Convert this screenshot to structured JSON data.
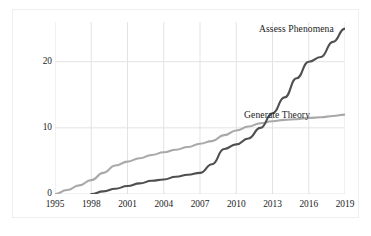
{
  "chart_data": {
    "type": "line",
    "title": "",
    "xlabel": "",
    "ylabel": "Cumulative number of studies",
    "xlim": [
      1995,
      2019
    ],
    "ylim": [
      0,
      26
    ],
    "yticks": [
      0,
      10,
      20
    ],
    "xticks": [
      1995,
      1998,
      2001,
      2004,
      2007,
      2010,
      2013,
      2016,
      2019
    ],
    "grid": true,
    "legend_position": "inline-annotations",
    "series": [
      {
        "name": "Generate Theory",
        "color": "#a9a9a9",
        "x": [
          1995,
          1996,
          1997,
          1998,
          1999,
          2000,
          2001,
          2002,
          2003,
          2004,
          2005,
          2006,
          2007,
          2008,
          2009,
          2010,
          2011,
          2012,
          2013,
          2014,
          2015,
          2016,
          2017,
          2018,
          2019
        ],
        "values": [
          0,
          0.6,
          1.3,
          2.1,
          3.2,
          4.3,
          4.9,
          5.4,
          5.9,
          6.3,
          6.7,
          7.1,
          7.6,
          8.0,
          8.9,
          9.6,
          10.2,
          10.7,
          11.0,
          11.2,
          11.3,
          11.5,
          11.6,
          11.8,
          12.0
        ]
      },
      {
        "name": "Assess Phenomena",
        "color": "#4f4f4f",
        "x": [
          1998,
          1999,
          2000,
          2001,
          2002,
          2003,
          2004,
          2005,
          2006,
          2007,
          2008,
          2009,
          2010,
          2011,
          2012,
          2013,
          2014,
          2015,
          2016,
          2017,
          2018,
          2019
        ],
        "values": [
          0,
          0.4,
          0.8,
          1.2,
          1.6,
          2.0,
          2.2,
          2.6,
          2.9,
          3.2,
          4.5,
          6.8,
          7.5,
          8.4,
          10.0,
          12.2,
          14.6,
          17.5,
          20.0,
          20.7,
          23.0,
          25.0
        ]
      }
    ],
    "annotations": [
      {
        "text": "Assess Phenomena",
        "series": "Assess Phenomena"
      },
      {
        "text": "Generate Theory",
        "series": "Generate Theory"
      }
    ]
  },
  "axis": {
    "ylabel": "Cumulative number of studies",
    "yticks": [
      "0",
      "10",
      "20"
    ],
    "xticks": [
      "1995",
      "1998",
      "2001",
      "2004",
      "2007",
      "2010",
      "2013",
      "2016",
      "2019"
    ]
  },
  "labels": {
    "assess": "Assess Phenomena",
    "generate": "Generate Theory"
  },
  "colors": {
    "assess_line": "#4f4f4f",
    "generate_line": "#a9a9a9",
    "grid": "#e3e3e3",
    "text": "#1c1c1c",
    "frame": "#eeeeee"
  }
}
